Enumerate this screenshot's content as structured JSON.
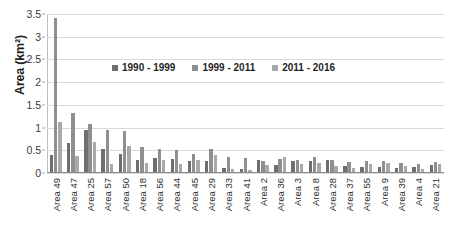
{
  "chart_data": {
    "type": "bar",
    "title": "",
    "xlabel": "",
    "ylabel": "Area (km²)",
    "ylim": [
      0,
      3.5
    ],
    "yticks": [
      0,
      0.5,
      1,
      1.5,
      2,
      2.5,
      3,
      3.5
    ],
    "ytick_labels": [
      "0",
      "0.5",
      "1",
      "1.5",
      "2",
      "2.5",
      "3",
      "3.5"
    ],
    "grid": true,
    "legend_position": "upper-center",
    "categories": [
      "Area 49",
      "Area 47",
      "Area 25",
      "Area 57",
      "Area 50",
      "Area 18",
      "Area 56",
      "Area 44",
      "Area 45",
      "Area 29",
      "Area 33",
      "Area 41",
      "Area 2",
      "Area 36",
      "Area 3",
      "Area 8",
      "Area 28",
      "Area 37",
      "Area 55",
      "Area 9",
      "Area 39",
      "Area 4",
      "Area 21"
    ],
    "series": [
      {
        "name": "1990 - 1999",
        "color": "#6e6e6e",
        "values": [
          0.37,
          0.65,
          0.94,
          0.51,
          0.39,
          0.26,
          0.32,
          0.29,
          0.24,
          0.25,
          0.08,
          0.06,
          0.27,
          0.16,
          0.24,
          0.25,
          0.26,
          0.14,
          0.12,
          0.11,
          0.09,
          0.11,
          0.16
        ]
      },
      {
        "name": "1999 - 2011",
        "color": "#8f8f8f",
        "values": [
          3.42,
          1.31,
          1.06,
          0.94,
          0.9,
          0.55,
          0.51,
          0.48,
          0.39,
          0.52,
          0.33,
          0.3,
          0.25,
          0.28,
          0.26,
          0.33,
          0.27,
          0.22,
          0.25,
          0.24,
          0.2,
          0.17,
          0.23
        ]
      },
      {
        "name": "2011 - 2016",
        "color": "#a9a9a9",
        "values": [
          1.1,
          0.36,
          0.67,
          0.17,
          0.58,
          0.21,
          0.26,
          0.17,
          0.26,
          0.37,
          0.06,
          0.05,
          0.16,
          0.34,
          0.17,
          0.2,
          0.13,
          0.08,
          0.18,
          0.2,
          0.13,
          0.06,
          0.17
        ]
      }
    ]
  }
}
